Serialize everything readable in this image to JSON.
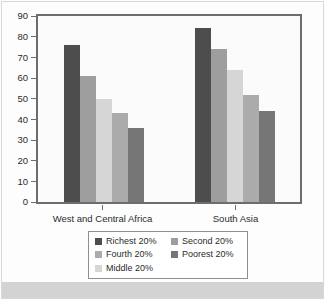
{
  "chart_data": {
    "type": "bar",
    "title": "",
    "xlabel": "",
    "ylabel": "",
    "ylim": [
      0,
      90
    ],
    "yticks": [
      90,
      80,
      70,
      60,
      50,
      40,
      30,
      20,
      10,
      0
    ],
    "grid": false,
    "legend_position": "bottom",
    "categories": [
      "West and Central Africa",
      "South Asia"
    ],
    "series": [
      {
        "name": "Richest 20%",
        "color": "#4d4d4d",
        "values": [
          76,
          84
        ]
      },
      {
        "name": "Second 20%",
        "color": "#9e9e9e",
        "values": [
          61,
          74
        ]
      },
      {
        "name": "Middle 20%",
        "color": "#d6d6d6",
        "values": [
          50,
          64
        ]
      },
      {
        "name": "Fourth 20%",
        "color": "#ababab",
        "values": [
          43,
          52
        ]
      },
      {
        "name": "Poorest 20%",
        "color": "#767676",
        "values": [
          36,
          44
        ]
      }
    ],
    "legend_order": [
      "Richest 20%",
      "Second 20%",
      "Fourth 20%",
      "Poorest 20%",
      "Middle 20%"
    ]
  },
  "colors": {
    "plot_frame": "#6d6d6d",
    "plot_background": "#fbfbfb",
    "figure_background": "#fdfdfd",
    "bottom_band": "#d3d3d3",
    "text": "#2b2b2b",
    "legend_border": "#8e8e8e"
  }
}
